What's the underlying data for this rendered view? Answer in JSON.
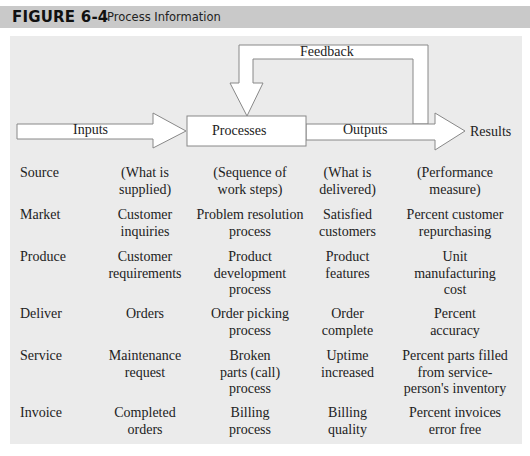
{
  "header": {
    "figure_label": "FIGURE 6-4",
    "title": "Process Information"
  },
  "diagram": {
    "feedback_label": "Feedback",
    "inputs_label": "Inputs",
    "processes_label": "Processes",
    "outputs_label": "Outputs",
    "results_label": "Results"
  },
  "colors": {
    "header_bg": "#c9c9c9",
    "panel_bg": "#ebebeb",
    "arrow_fill": "#ffffff",
    "arrow_stroke": "#888888"
  },
  "table": {
    "columns": [
      "Source",
      "Inputs",
      "Processes",
      "Outputs",
      "Results"
    ],
    "rows": [
      {
        "source": "Source",
        "inputs": "(What is\nsupplied)",
        "processes": "(Sequence of\nwork steps)",
        "outputs": "(What is\ndelivered)",
        "results": "(Performance\nmeasure)"
      },
      {
        "source": "Market",
        "inputs": "Customer\ninquiries",
        "processes": "Problem resolution\nprocess",
        "outputs": "Satisfied\ncustomers",
        "results": "Percent customer\nrepurchasing"
      },
      {
        "source": "Produce",
        "inputs": "Customer\nrequirements",
        "processes": "Product\ndevelopment\nprocess",
        "outputs": "Product\nfeatures",
        "results": "Unit\nmanufacturing\ncost"
      },
      {
        "source": "Deliver",
        "inputs": "Orders",
        "processes": "Order picking\nprocess",
        "outputs": "Order\ncomplete",
        "results": "Percent\naccuracy"
      },
      {
        "source": "Service",
        "inputs": "Maintenance\nrequest",
        "processes": "Broken\nparts (call)\nprocess",
        "outputs": "Uptime\nincreased",
        "results": "Percent parts filled\nfrom service-\nperson's inventory"
      },
      {
        "source": "Invoice",
        "inputs": "Completed\norders",
        "processes": "Billing\nprocess",
        "outputs": "Billing\nquality",
        "results": "Percent invoices\nerror free"
      }
    ]
  }
}
